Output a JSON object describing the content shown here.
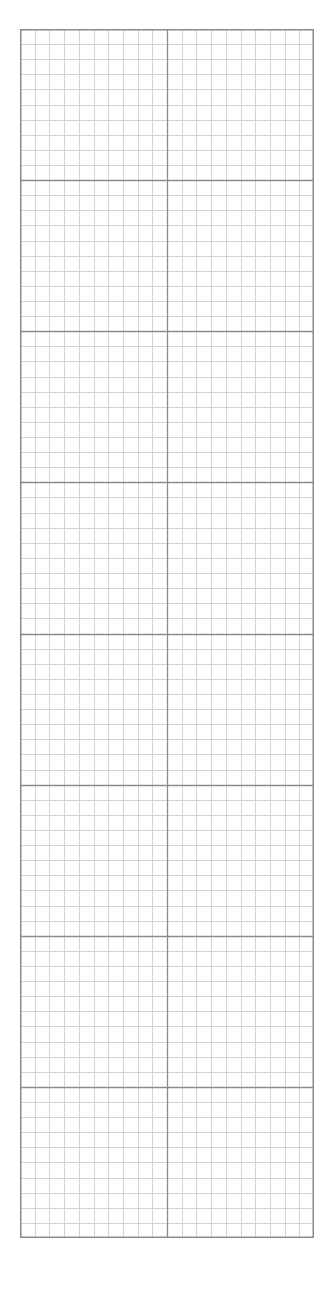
{
  "sheet": {
    "type": "graph-paper",
    "major_columns": 2,
    "major_rows": 8,
    "minor_divisions_per_major": 10,
    "colors": {
      "background": "#ffffff",
      "minor_line": "#d4d4d4",
      "major_line": "#8a8a8a",
      "border": "#8a8a8a"
    }
  }
}
